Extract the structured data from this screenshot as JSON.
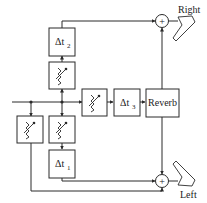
{
  "diagram": {
    "type": "audio-signal-flow",
    "blocks": {
      "delay2": {
        "label": "Δt",
        "sub": "2"
      },
      "delay1": {
        "label": "Δt",
        "sub": "1"
      },
      "delay3": {
        "label": "Δt",
        "sub": "3"
      },
      "reverb": {
        "label": "Reverb"
      },
      "att_upper": {
        "kind": "attenuator"
      },
      "att_lower_left": {
        "kind": "attenuator"
      },
      "att_lower_center": {
        "kind": "attenuator"
      },
      "att_middle": {
        "kind": "attenuator"
      }
    },
    "summers": {
      "right": {
        "symbol": "+"
      },
      "left": {
        "symbol": "+"
      }
    },
    "outputs": {
      "right": {
        "label": "Right"
      },
      "left": {
        "label": "Left"
      }
    },
    "colors": {
      "stroke": "#2a2a2a",
      "background": "#ffffff"
    }
  }
}
